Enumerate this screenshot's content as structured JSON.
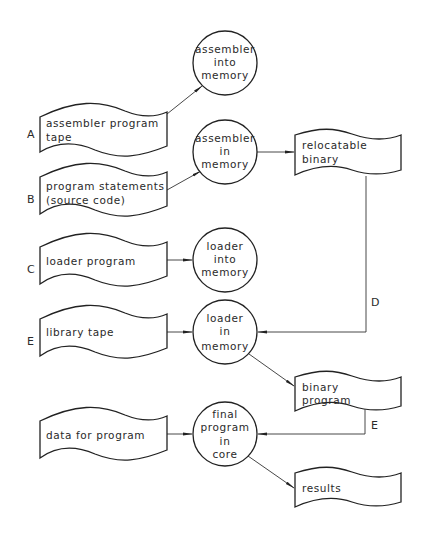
{
  "inputs": [
    {
      "label": "A",
      "lines": [
        "assembler program",
        "tape"
      ]
    },
    {
      "label": "B",
      "lines": [
        "program statements",
        "(source code)"
      ]
    },
    {
      "label": "C",
      "lines": [
        "loader program"
      ]
    },
    {
      "label": "E",
      "lines": [
        "library tape"
      ]
    },
    {
      "label": "",
      "lines": [
        "data for program"
      ]
    }
  ],
  "processes": [
    {
      "lines": [
        "assembler",
        "into",
        "memory"
      ]
    },
    {
      "lines": [
        "assembler",
        "in",
        "memory"
      ]
    },
    {
      "lines": [
        "loader",
        "into",
        "memory"
      ]
    },
    {
      "lines": [
        "loader",
        "in",
        "memory"
      ]
    },
    {
      "lines": [
        "final",
        "program",
        "in",
        "core"
      ]
    }
  ],
  "outputs": [
    {
      "lines": [
        "relocatable",
        "binary"
      ]
    },
    {
      "lines": [
        "binary",
        "program"
      ]
    },
    {
      "lines": [
        "results"
      ]
    }
  ],
  "connector_labels": {
    "d": "D",
    "e": "E"
  },
  "colors": {
    "ink": "#222222",
    "background": "#ffffff"
  }
}
